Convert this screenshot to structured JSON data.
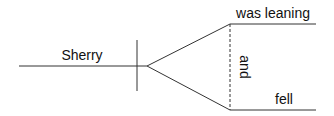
{
  "diagram": {
    "type": "sentence-diagram",
    "subject": "Sherry",
    "predicates": [
      "was leaning",
      "fell"
    ],
    "conjunction": "and",
    "line_color": "#333333",
    "text_color": "#111111"
  }
}
